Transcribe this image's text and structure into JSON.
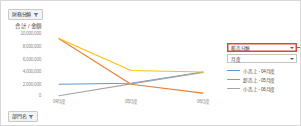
{
  "window": {
    "title": "ピボットグラフ"
  },
  "slicers": [
    {
      "id": "financial",
      "label": "財務分類",
      "icon": "filter-funnel-icon"
    },
    {
      "id": "dept",
      "label": "部門名",
      "icon": "filter-funnel-icon"
    }
  ],
  "right_panel": {
    "filters": [
      {
        "label": "販売分類",
        "highlighted": true,
        "icon": "chevron-down-icon"
      },
      {
        "label": "月度",
        "highlighted": false,
        "icon": "chevron-down-icon"
      }
    ]
  },
  "colors": {
    "series_blue": "#5b9bd5",
    "series_orange": "#ed7d31",
    "series_gray": "#a5a5a5",
    "series_yellow": "#ffc000",
    "highlight_red": "#e0443e",
    "axis_text": "#8a8a8a",
    "panel_border": "#c4c4c4",
    "slicer_fill": "#f3f3f3"
  },
  "chart_data": {
    "type": "line",
    "title": "合計 / 金額",
    "xlabel": "",
    "ylabel": "",
    "ylim": [
      0,
      10000000
    ],
    "ytick_labels": [
      "10,000,000",
      "8,000,000",
      "6,000,000",
      "4,000,000",
      "2,000,000",
      "0"
    ],
    "ytick_values": [
      10000000,
      8000000,
      6000000,
      4000000,
      2000000,
      0
    ],
    "categories": [
      "04月度",
      "05月度",
      "06月度"
    ],
    "grid": false,
    "legend_position": "right",
    "series": [
      {
        "name": "小売上 - 04月度",
        "color": "#5b9bd5",
        "values": [
          2000000,
          2150000,
          3900000
        ]
      },
      {
        "name": "卸売上 - 05月度",
        "color": "#ed7d31",
        "values": [
          9100000,
          2000000,
          600000
        ]
      },
      {
        "name": "小売上 - 06月度",
        "color": "#a5a5a5",
        "values": [
          200000,
          2050000,
          3850000
        ]
      },
      {
        "name": "総売上",
        "color": "#ffc000",
        "values": [
          9150000,
          4150000,
          3900000
        ]
      }
    ]
  }
}
